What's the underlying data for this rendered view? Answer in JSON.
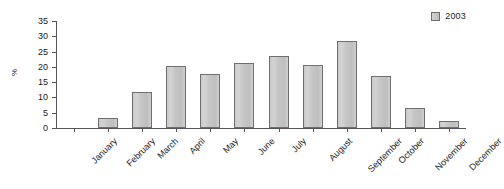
{
  "chart_data": {
    "type": "bar",
    "title": "",
    "xlabel": "",
    "ylabel": "%",
    "categories": [
      "January",
      "February",
      "March",
      "April",
      "May",
      "June",
      "July",
      "August",
      "September",
      "October",
      "November",
      "December"
    ],
    "series": [
      {
        "name": "2003",
        "values": [
          0,
          3.4,
          11.7,
          20.4,
          17.6,
          21.4,
          23.7,
          20.7,
          28.5,
          17.0,
          6.6,
          2.2
        ]
      }
    ],
    "ylim": [
      0,
      35
    ],
    "ytick_values": [
      0,
      5,
      10,
      15,
      20,
      25,
      30,
      35
    ],
    "ytick_labels": [
      "0",
      "5",
      "10",
      "15",
      "20",
      "25",
      "30",
      "35"
    ],
    "grid": false,
    "legend_position": "top-right",
    "xtick_label_rotation": -45,
    "colors": {
      "bar_fill": "#c8c8c8",
      "bar_border": "#6f6f6f",
      "axis": "#555555",
      "text": "#1a1a1a",
      "background": "#ffffff"
    }
  },
  "legend": {
    "entries": [
      {
        "label": "2003",
        "swatch_color": "#c8c8c8"
      }
    ]
  },
  "axes": {
    "y_axis_label": "%"
  }
}
